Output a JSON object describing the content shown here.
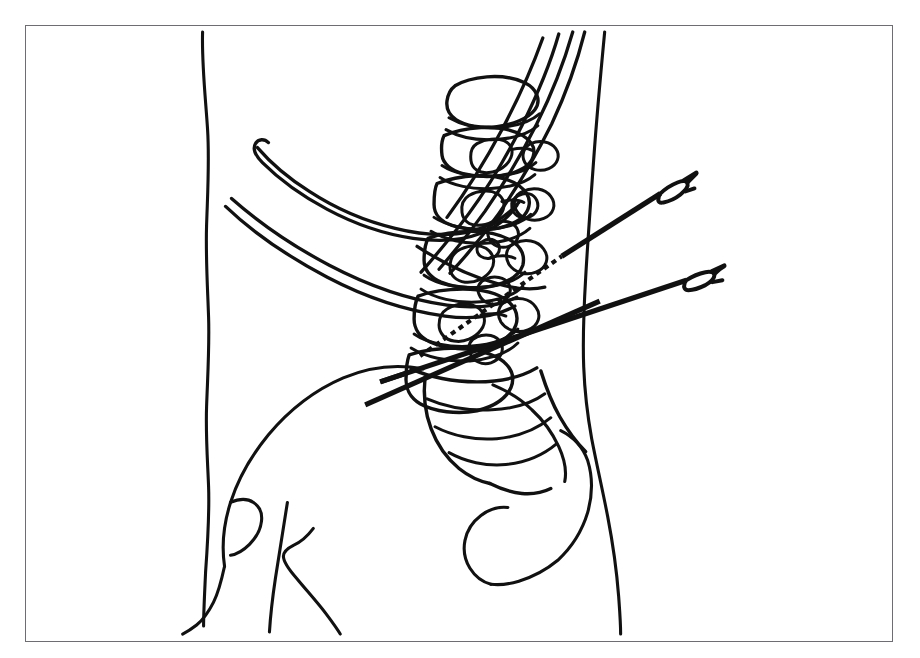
{
  "figure": {
    "caption": "",
    "frame": {
      "border_color": "#6e6e72",
      "background": "#ffffff"
    },
    "ink_color": "#111111",
    "view": "lateral (sagittal) torso, patient facing left",
    "anatomy_labels": [
      "anterior-abdominal-skin-contour",
      "posterior-back-skin-contour",
      "twelfth-rib",
      "eleventh-rib",
      "tenth-rib",
      "thoracic-vertebra-T12",
      "lumbar-vertebra-L1",
      "lumbar-vertebra-L2",
      "lumbar-vertebra-L3",
      "lumbar-vertebra-L4",
      "lumbar-vertebra-L5",
      "spinous-processes",
      "sacrum",
      "coccyx",
      "iliac-crest",
      "ilium",
      "gluteal-contour",
      "thigh-contour"
    ],
    "instruments": [
      {
        "name": "upper-block-needle",
        "label": "upper needle",
        "entry_side": "posterior",
        "trajectory": "oblique antero-superior toward vertebral body",
        "hub": "fork-shaped hub",
        "deep_segment_style": "dashed",
        "shaft_style": "solid"
      },
      {
        "name": "lower-block-needle",
        "label": "lower needle",
        "entry_side": "posterior",
        "trajectory": "oblique antero-superior toward L4-L5 level",
        "hub": "fork-shaped hub",
        "deep_segment_style": "solid",
        "shaft_style": "solid"
      }
    ]
  }
}
